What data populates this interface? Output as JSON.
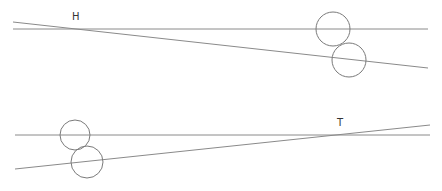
{
  "canvas": {
    "width": 442,
    "height": 191,
    "background": "#ffffff"
  },
  "diagrams": [
    {
      "name": "top",
      "label": "H",
      "label_pos": {
        "x": 72,
        "y": 20
      },
      "horizontal_line": {
        "x1": 13,
        "y1": 29,
        "x2": 428,
        "y2": 29
      },
      "sloped_line": {
        "x1": 13,
        "y1": 22,
        "x2": 428,
        "y2": 68
      },
      "circles": [
        {
          "cx": 333,
          "cy": 29,
          "r": 17
        },
        {
          "cx": 349,
          "cy": 60,
          "r": 17
        }
      ]
    },
    {
      "name": "bottom",
      "label": "T",
      "label_pos": {
        "x": 337,
        "y": 126
      },
      "horizontal_line": {
        "x1": 15,
        "y1": 135,
        "x2": 430,
        "y2": 135
      },
      "sloped_line": {
        "x1": 15,
        "y1": 169,
        "x2": 430,
        "y2": 125
      },
      "circles": [
        {
          "cx": 75,
          "cy": 135,
          "r": 15
        },
        {
          "cx": 87,
          "cy": 162,
          "r": 16
        }
      ]
    }
  ],
  "colors": {
    "line": "#8a8a8a",
    "circle": "#7a7a7a",
    "text": "#333333"
  }
}
